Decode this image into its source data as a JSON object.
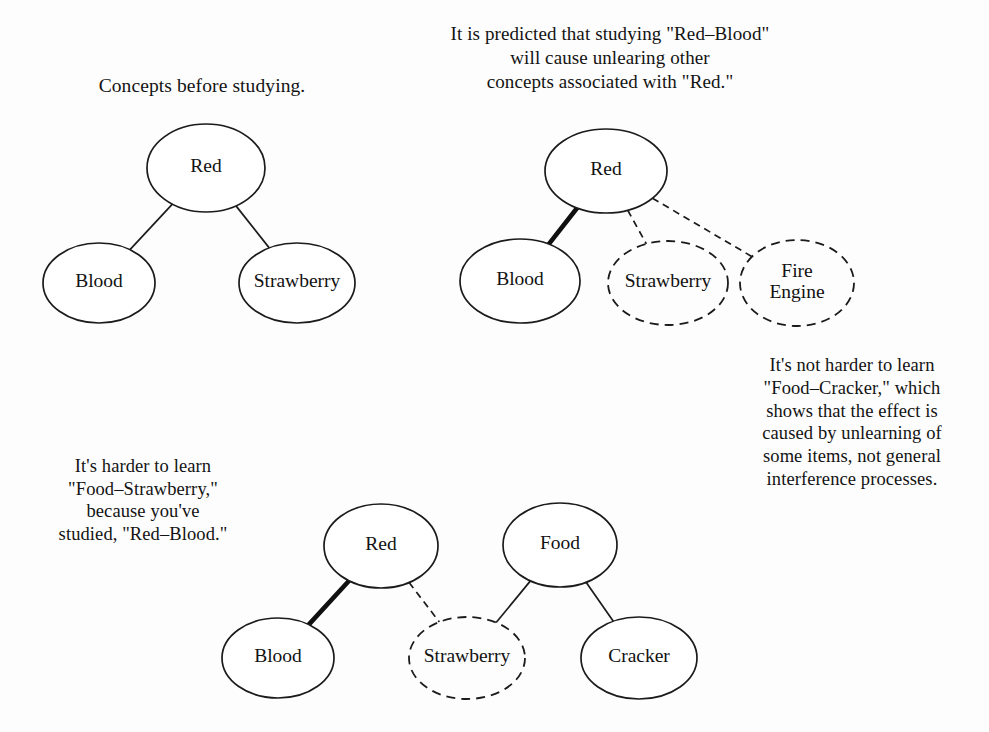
{
  "figure": {
    "background_color": "#fdfdfd",
    "ink_color": "#121212"
  },
  "captions": {
    "before_studying": "Concepts before studying.",
    "prediction": "It is predicted that studying \"Red–Blood\"\nwill cause unlearing other\nconcepts associated with \"Red.\"",
    "harder_strawberry": "It's harder to learn\n\"Food–Strawberry,\"\nbecause you've\nstudied, \"Red–Blood.\"",
    "not_harder_cracker": "It's not harder to learn\n\"Food–Cracker,\" which\nshows that the effect is\ncaused by unlearning of\nsome items, not general\ninterference processes."
  },
  "diagrams": [
    {
      "id": "panel-before-studying",
      "name": "Concepts before studying",
      "nodes": [
        {
          "id": "n1-red",
          "label": "Red",
          "style": "solid",
          "cx": 206,
          "cy": 168,
          "rx": 59,
          "ry": 44
        },
        {
          "id": "n1-blood",
          "label": "Blood",
          "style": "solid",
          "cx": 99,
          "cy": 283,
          "rx": 56,
          "ry": 40
        },
        {
          "id": "n1-strawberry",
          "label": "Strawberry",
          "style": "solid",
          "cx": 297,
          "cy": 283,
          "rx": 58,
          "ry": 40
        }
      ],
      "edges": [
        {
          "id": "e1-red-blood",
          "from": "Red",
          "to": "Blood",
          "style": "normal"
        },
        {
          "id": "e1-red-strawberry",
          "from": "Red",
          "to": "Strawberry",
          "style": "normal"
        }
      ]
    },
    {
      "id": "panel-prediction",
      "name": "Predicted unlearning after studying Red-Blood",
      "nodes": [
        {
          "id": "n2-red",
          "label": "Red",
          "style": "solid",
          "cx": 606,
          "cy": 171,
          "rx": 61,
          "ry": 42
        },
        {
          "id": "n2-blood",
          "label": "Blood",
          "style": "solid",
          "cx": 520,
          "cy": 281,
          "rx": 60,
          "ry": 42
        },
        {
          "id": "n2-strawberry",
          "label": "Strawberry",
          "style": "dashed",
          "cx": 668,
          "cy": 283,
          "rx": 60,
          "ry": 42
        },
        {
          "id": "n2-fire-engine",
          "label": "Fire\nEngine",
          "style": "dashed",
          "cx": 797,
          "cy": 283,
          "rx": 57,
          "ry": 43
        }
      ],
      "edges": [
        {
          "id": "e2-red-blood",
          "from": "Red",
          "to": "Blood",
          "style": "bold"
        },
        {
          "id": "e2-red-strawberry",
          "from": "Red",
          "to": "Strawberry",
          "style": "dashed"
        },
        {
          "id": "e2-red-fire-engine",
          "from": "Red",
          "to": "Fire Engine",
          "style": "dashed"
        }
      ]
    },
    {
      "id": "panel-food-strawberry",
      "name": "Learning Food-Strawberry versus Food-Cracker",
      "nodes": [
        {
          "id": "n3-red",
          "label": "Red",
          "style": "solid",
          "cx": 381,
          "cy": 546,
          "rx": 57,
          "ry": 42
        },
        {
          "id": "n3-food",
          "label": "Food",
          "style": "solid",
          "cx": 560,
          "cy": 545,
          "rx": 57,
          "ry": 42
        },
        {
          "id": "n3-blood",
          "label": "Blood",
          "style": "solid",
          "cx": 278,
          "cy": 658,
          "rx": 56,
          "ry": 40
        },
        {
          "id": "n3-strawberry",
          "label": "Strawberry",
          "style": "dashed",
          "cx": 467,
          "cy": 658,
          "rx": 58,
          "ry": 41
        },
        {
          "id": "n3-cracker",
          "label": "Cracker",
          "style": "solid",
          "cx": 639,
          "cy": 658,
          "rx": 58,
          "ry": 41
        }
      ],
      "edges": [
        {
          "id": "e3-red-blood",
          "from": "Red",
          "to": "Blood",
          "style": "bold"
        },
        {
          "id": "e3-red-strawberry",
          "from": "Red",
          "to": "Strawberry",
          "style": "dashed"
        },
        {
          "id": "e3-food-strawberry",
          "from": "Food",
          "to": "Strawberry",
          "style": "normal"
        },
        {
          "id": "e3-food-cracker",
          "from": "Food",
          "to": "Cracker",
          "style": "normal"
        }
      ]
    }
  ]
}
